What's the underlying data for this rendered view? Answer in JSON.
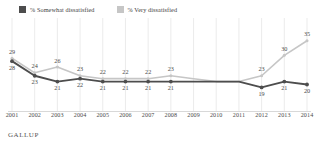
{
  "legend": {
    "entries": [
      {
        "label": "% Somewhat dissatisfied",
        "color": "#4d4d4d",
        "icon": "legend-swatch-icon"
      },
      {
        "label": "% Very dissatisfied",
        "color": "#c6c6c6",
        "icon": "legend-swatch-icon"
      }
    ]
  },
  "footer": {
    "source": "GALLUP"
  },
  "chart_data": {
    "type": "line",
    "title": "",
    "subtitle": "",
    "xlabel": "",
    "ylabel": "",
    "ylim": [
      14,
      38
    ],
    "grid": "vertical",
    "legend_position": "top-left",
    "categories": [
      "2001",
      "2002",
      "2003",
      "2004",
      "2005",
      "2006",
      "2007",
      "2008",
      "2009",
      "2010",
      "2011",
      "2012",
      "2013",
      "2014"
    ],
    "series": [
      {
        "name": "% Very dissatisfied",
        "color": "#c6c6c6",
        "label_position": "above",
        "values": [
          29,
          24,
          26,
          23,
          22,
          22,
          22,
          23,
          22,
          21,
          21,
          23,
          30,
          35
        ],
        "labels": [
          "29",
          "24",
          "26",
          "23",
          "22",
          "22",
          "22",
          "23",
          "",
          "",
          "",
          "23",
          "30",
          "35"
        ]
      },
      {
        "name": "% Somewhat dissatisfied",
        "color": "#4d4d4d",
        "label_position": "below",
        "values": [
          28,
          23,
          21,
          22,
          21,
          21,
          21,
          21,
          21,
          21,
          21,
          19,
          21,
          20
        ],
        "labels": [
          "28",
          "23",
          "21",
          "22",
          "21",
          "21",
          "21",
          "21",
          "",
          "",
          "",
          "19",
          "21",
          "20"
        ]
      }
    ]
  }
}
